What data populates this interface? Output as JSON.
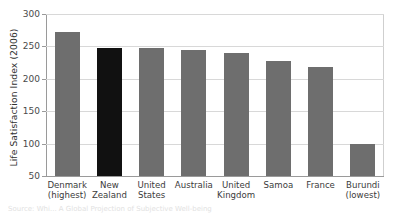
{
  "chart_data": {
    "type": "bar",
    "title": "",
    "xlabel": "",
    "ylabel": "Life Satisfaction Index (2006)",
    "ylim": [
      50,
      300
    ],
    "yticks": [
      300,
      250,
      200,
      150,
      100,
      50
    ],
    "grid": true,
    "legend": "none",
    "categories": [
      "Denmark (highest)",
      "New Zealand",
      "United States",
      "Australia",
      "United Kingdom",
      "Samoa",
      "France",
      "Burundi (lowest)"
    ],
    "category_lines": [
      [
        "Denmark",
        "(highest)"
      ],
      [
        "New",
        "Zealand"
      ],
      [
        "United",
        "States"
      ],
      [
        "Australia",
        ""
      ],
      [
        "United",
        "Kingdom"
      ],
      [
        "Samoa",
        ""
      ],
      [
        "France",
        ""
      ],
      [
        "Burundi",
        "(lowest)"
      ]
    ],
    "values": [
      272,
      247,
      247,
      245,
      240,
      228,
      219,
      100
    ],
    "highlight_index": 1,
    "colors": {
      "bar": "#6e6e6e",
      "bar_highlight": "#111111",
      "gridline": "#d8d8d8",
      "axis": "#9a9a9a",
      "text": "#3b3b3b"
    }
  },
  "axis": {
    "y_title": "Life Satisfaction Index (2006)",
    "tick_labels": [
      "300",
      "250",
      "200",
      "150",
      "100",
      "50"
    ]
  },
  "caption": {
    "text": "Source: Whi... A Global Projection of Subjective Well-being"
  }
}
